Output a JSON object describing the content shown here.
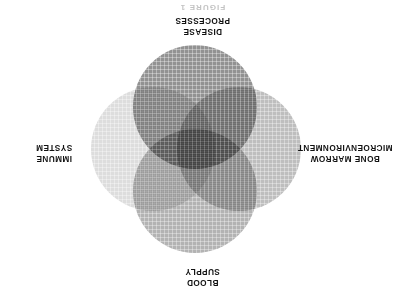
{
  "figure": {
    "orientation_degrees": 180,
    "background_color": "#ffffff",
    "title_partial": "FIGURE 1"
  },
  "labels": {
    "top": "BLOOD\nSUPPLY",
    "right": "IMMUNE\nSYSTEM",
    "bottom": "DISEASE\nPROCESSES",
    "left": "BONE MARROW\nMICROENVIRONMENT"
  },
  "chart_data": {
    "type": "venn",
    "title": "",
    "subtitle": "",
    "xlabel": "",
    "ylabel": "",
    "grid": true,
    "legend_position": "outside-around",
    "set_count": 4,
    "categories": [
      "BLOOD SUPPLY",
      "IMMUNE SYSTEM",
      "DISEASE PROCESSES",
      "BONE MARROW MICROENVIRONMENT"
    ],
    "sets": [
      {
        "name": "BLOOD SUPPLY",
        "position": "top",
        "center": [
          210,
          110
        ],
        "radius": 62,
        "fill": "#969696",
        "opacity": 0.72
      },
      {
        "name": "IMMUNE SYSTEM",
        "position": "right",
        "center": [
          252,
          152
        ],
        "radius": 62,
        "fill": "#cdcdcd",
        "opacity": 0.68
      },
      {
        "name": "DISEASE PROCESSES",
        "position": "bottom",
        "center": [
          210,
          194
        ],
        "radius": 62,
        "fill": "#686868",
        "opacity": 0.72
      },
      {
        "name": "BONE MARROW MICROENVIRONMENT",
        "position": "left",
        "center": [
          166,
          152
        ],
        "radius": 62,
        "fill": "#a2a2a2",
        "opacity": 0.7
      }
    ],
    "values": [
      1,
      1,
      1,
      1
    ],
    "all_sets_overlap": true
  },
  "colors": {
    "text": "#111111",
    "background": "#ffffff",
    "lightest_set": "#cdcdcd",
    "darkest_set": "#686868"
  }
}
